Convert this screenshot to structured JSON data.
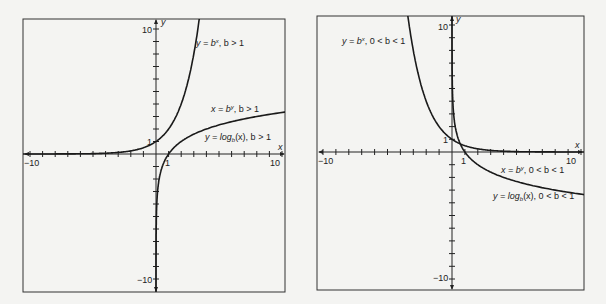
{
  "chart_data": [
    {
      "type": "line",
      "title": "",
      "xlabel": "x",
      "ylabel": "y",
      "xlim": [
        -10.5,
        10.3
      ],
      "ylim": [
        -11,
        10.8
      ],
      "grid": false,
      "x_tick_labels": [
        "-10",
        "1",
        "10"
      ],
      "y_tick_labels": [
        "10",
        "1",
        "-10"
      ],
      "series": [
        {
          "name": "y = b^x, b > 1",
          "label_parts": [
            "y = b",
            "x",
            ", b > 1"
          ],
          "function": "exp",
          "base": 2,
          "x": [
            -10,
            -6,
            -4,
            -2,
            -1,
            0,
            1,
            2,
            3,
            3.4
          ],
          "y": [
            0.001,
            0.016,
            0.06,
            0.25,
            0.5,
            1,
            2,
            4,
            8,
            10.6
          ]
        },
        {
          "name": "x = b^y, b > 1",
          "label_parts": [
            "x = b",
            "y",
            ", b > 1"
          ],
          "function": "log",
          "base": 2,
          "x": [
            0.001,
            0.016,
            0.06,
            0.25,
            0.5,
            1,
            2,
            4,
            8,
            10.3
          ],
          "y": [
            -10,
            -6,
            -4,
            -2,
            -1,
            0,
            1,
            2,
            3,
            3.36
          ]
        },
        {
          "name": "y = log_b(x), b > 1",
          "label_parts": [
            "y = log",
            "b",
            "(x), b > 1"
          ],
          "note": "same curve as x = b^y"
        }
      ],
      "annotations": [
        "1 (y-intercept of y = b^x)",
        "1 (x-intercept of y = log_b(x))"
      ]
    },
    {
      "type": "line",
      "title": "",
      "xlabel": "x",
      "ylabel": "y",
      "xlim": [
        -10.5,
        10.3
      ],
      "ylim": [
        -11,
        10.8
      ],
      "grid": false,
      "x_tick_labels": [
        "-10",
        "1",
        "10"
      ],
      "y_tick_labels": [
        "10",
        "1",
        "-10"
      ],
      "series": [
        {
          "name": "y = b^x, 0 < b < 1",
          "label_parts": [
            "y = b",
            "x",
            ", 0 < b < 1"
          ],
          "function": "exp",
          "base": 0.5,
          "x": [
            -3.4,
            -3,
            -2,
            -1,
            0,
            1,
            2,
            4,
            6,
            10
          ],
          "y": [
            10.6,
            8,
            4,
            2,
            1,
            0.5,
            0.25,
            0.06,
            0.016,
            0.001
          ]
        },
        {
          "name": "x = b^y, 0 < b < 1",
          "label_parts": [
            "x = b",
            "y",
            ", 0 < b < 1"
          ],
          "function": "log",
          "base": 0.5,
          "x": [
            0.1,
            0.25,
            0.5,
            1,
            2,
            4,
            8,
            10.3
          ],
          "y": [
            3.32,
            2,
            1,
            0,
            -1,
            -2,
            -3,
            -3.36
          ]
        },
        {
          "name": "y = log_b(x), 0 < b < 1",
          "label_parts": [
            "y = log",
            "b",
            "(x), 0 < b < 1"
          ],
          "note": "same curve as x = b^y"
        }
      ],
      "annotations": [
        "1",
        "1"
      ]
    }
  ],
  "panels": [
    {
      "axis_labels": {
        "x": "x",
        "y": "y"
      },
      "ticks": {
        "x_neg": "−10",
        "x_pos": "10",
        "x_one": "1",
        "y_pos": "10",
        "y_neg": "−10",
        "y_one": "1"
      },
      "curve_labels": {
        "exp": {
          "a": "y = b",
          "sup": "x",
          "b": ", b > 1"
        },
        "inv": {
          "a": "x = b",
          "sup": "y",
          "b": ", b > 1"
        },
        "log": {
          "a": "y = log",
          "sub": "b",
          "b": "(x), b > 1"
        }
      }
    },
    {
      "axis_labels": {
        "x": "x",
        "y": "y"
      },
      "ticks": {
        "x_neg": "−10",
        "x_pos": "10",
        "x_one": "1",
        "y_pos": "10",
        "y_neg": "−10",
        "y_one": "1"
      },
      "curve_labels": {
        "exp": {
          "a": "y = b",
          "sup": "x",
          "b": ", 0 < b < 1"
        },
        "inv": {
          "a": "x = b",
          "sup": "y",
          "b": ", 0 < b < 1"
        },
        "log": {
          "a": "y = log",
          "sub": "b",
          "b": "(x), 0 < b < 1"
        }
      }
    }
  ]
}
